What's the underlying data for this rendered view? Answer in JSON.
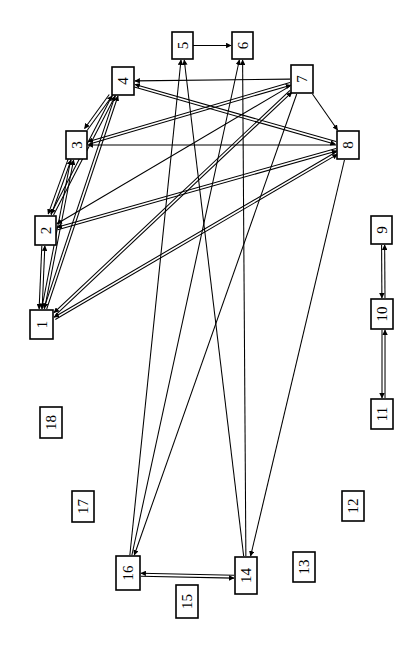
{
  "diagram": {
    "type": "node-link-diagram",
    "orientation": "labels-rotated-90-ccw",
    "background_color": "#ffffff",
    "node_fill_color": "#ffffff",
    "node_stroke_color": "#000000",
    "edge_color": "#000000",
    "width": 416,
    "height": 647,
    "nodes": [
      {
        "id": "1",
        "label": "1",
        "x": 30,
        "y": 310,
        "w": 23,
        "h": 29
      },
      {
        "id": "2",
        "label": "2",
        "x": 35,
        "y": 216,
        "w": 21,
        "h": 29
      },
      {
        "id": "3",
        "label": "3",
        "x": 66,
        "y": 131,
        "w": 21,
        "h": 28
      },
      {
        "id": "4",
        "label": "4",
        "x": 112,
        "y": 67,
        "w": 22,
        "h": 28
      },
      {
        "id": "5",
        "label": "5",
        "x": 172,
        "y": 32,
        "w": 21,
        "h": 27
      },
      {
        "id": "6",
        "label": "6",
        "x": 232,
        "y": 32,
        "w": 21,
        "h": 27
      },
      {
        "id": "7",
        "label": "7",
        "x": 291,
        "y": 65,
        "w": 22,
        "h": 28
      },
      {
        "id": "8",
        "label": "8",
        "x": 337,
        "y": 131,
        "w": 22,
        "h": 28
      },
      {
        "id": "9",
        "label": "9",
        "x": 371,
        "y": 216,
        "w": 21,
        "h": 28
      },
      {
        "id": "10",
        "label": "10",
        "x": 371,
        "y": 299,
        "w": 22,
        "h": 30
      },
      {
        "id": "11",
        "label": "11",
        "x": 371,
        "y": 399,
        "w": 22,
        "h": 30
      },
      {
        "id": "12",
        "label": "12",
        "x": 342,
        "y": 491,
        "w": 22,
        "h": 30
      },
      {
        "id": "13",
        "label": "13",
        "x": 293,
        "y": 552,
        "w": 22,
        "h": 30
      },
      {
        "id": "14",
        "label": "14",
        "x": 235,
        "y": 557,
        "w": 22,
        "h": 37
      },
      {
        "id": "15",
        "label": "15",
        "x": 176,
        "y": 585,
        "w": 22,
        "h": 33
      },
      {
        "id": "16",
        "label": "16",
        "x": 116,
        "y": 556,
        "w": 24,
        "h": 34
      },
      {
        "id": "17",
        "label": "17",
        "x": 72,
        "y": 491,
        "w": 22,
        "h": 31
      },
      {
        "id": "18",
        "label": "18",
        "x": 40,
        "y": 407,
        "w": 22,
        "h": 31
      }
    ],
    "edges": [
      {
        "from": "5",
        "to": "6",
        "directed": "both"
      },
      {
        "from": "7",
        "to": "4",
        "directed": "to"
      },
      {
        "from": "8",
        "to": "3",
        "directed": "to"
      },
      {
        "from": "1",
        "to": "2",
        "directed": "to"
      },
      {
        "from": "2",
        "to": "1",
        "directed": "to"
      },
      {
        "from": "1",
        "to": "3",
        "directed": "to"
      },
      {
        "from": "3",
        "to": "1",
        "directed": "to"
      },
      {
        "from": "1",
        "to": "4",
        "directed": "to"
      },
      {
        "from": "4",
        "to": "1",
        "directed": "to"
      },
      {
        "from": "2",
        "to": "3",
        "directed": "to"
      },
      {
        "from": "3",
        "to": "2",
        "directed": "to"
      },
      {
        "from": "2",
        "to": "4",
        "directed": "to"
      },
      {
        "from": "4",
        "to": "2",
        "directed": "to"
      },
      {
        "from": "3",
        "to": "4",
        "directed": "to"
      },
      {
        "from": "4",
        "to": "3",
        "directed": "to"
      },
      {
        "from": "7",
        "to": "1",
        "directed": "to"
      },
      {
        "from": "7",
        "to": "2",
        "directed": "to"
      },
      {
        "from": "7",
        "to": "3",
        "directed": "to"
      },
      {
        "from": "8",
        "to": "1",
        "directed": "to"
      },
      {
        "from": "8",
        "to": "2",
        "directed": "to"
      },
      {
        "from": "8",
        "to": "4",
        "directed": "to"
      },
      {
        "from": "1",
        "to": "7",
        "directed": "to"
      },
      {
        "from": "1",
        "to": "8",
        "directed": "to"
      },
      {
        "from": "2",
        "to": "8",
        "directed": "to"
      },
      {
        "from": "3",
        "to": "7",
        "directed": "to"
      },
      {
        "from": "4",
        "to": "8",
        "directed": "to"
      },
      {
        "from": "7",
        "to": "8",
        "directed": "to"
      },
      {
        "from": "16",
        "to": "5",
        "directed": "to"
      },
      {
        "from": "16",
        "to": "6",
        "directed": "to"
      },
      {
        "from": "14",
        "to": "5",
        "directed": "to"
      },
      {
        "from": "14",
        "to": "6",
        "directed": "to"
      },
      {
        "from": "7",
        "to": "16",
        "directed": "to"
      },
      {
        "from": "8",
        "to": "14",
        "directed": "to"
      },
      {
        "from": "9",
        "to": "10",
        "directed": "to"
      },
      {
        "from": "10",
        "to": "9",
        "directed": "to"
      },
      {
        "from": "10",
        "to": "11",
        "directed": "to"
      },
      {
        "from": "11",
        "to": "10",
        "directed": "to"
      },
      {
        "from": "14",
        "to": "16",
        "directed": "to"
      },
      {
        "from": "16",
        "to": "14",
        "directed": "to"
      }
    ],
    "isolated_nodes": [
      "12",
      "13",
      "17",
      "18"
    ]
  }
}
